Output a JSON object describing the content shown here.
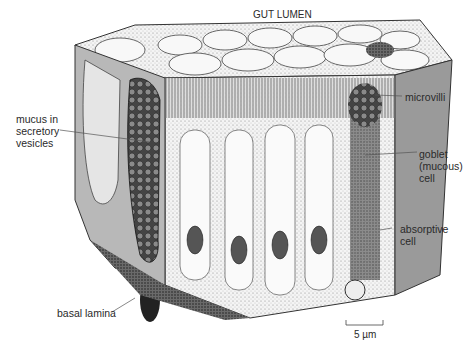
{
  "figure": {
    "title_label": "GUT LUMEN",
    "labels": {
      "mucus": "mucus in\nsecretory\nvesicles",
      "microvilli": "microvilli",
      "goblet": "goblet\n(mucous)\ncell",
      "absorptive": "absorptive\ncell",
      "basal_lamina": "basal lamina",
      "scale_bar": "5 µm"
    },
    "colors": {
      "ink": "#1a1a1a",
      "background": "#ffffff",
      "leader_line": "#555555"
    }
  }
}
